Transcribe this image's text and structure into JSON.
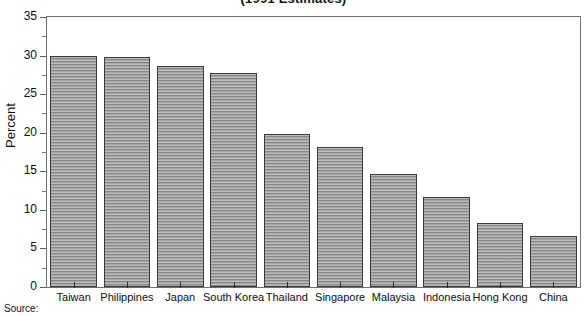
{
  "chart_data": {
    "type": "bar",
    "title": "(1991 Estimates)",
    "xlabel": "",
    "ylabel": "Percent",
    "ylim": [
      0,
      35
    ],
    "yticks": [
      0,
      5,
      10,
      15,
      20,
      25,
      30,
      35
    ],
    "grid": false,
    "legend": null,
    "categories": [
      "Taiwan",
      "Philippines",
      "Japan",
      "South Korea",
      "Thailand",
      "Singapore",
      "Malaysia",
      "Indonesia",
      "Hong Kong",
      "China"
    ],
    "values": [
      30.0,
      29.8,
      28.7,
      27.7,
      19.9,
      18.2,
      14.6,
      11.7,
      8.3,
      6.6
    ],
    "bar_color": "#9d9d9d",
    "bar_edge_color": "#3a3a3a"
  },
  "notes": {
    "source_label": "Source:"
  }
}
